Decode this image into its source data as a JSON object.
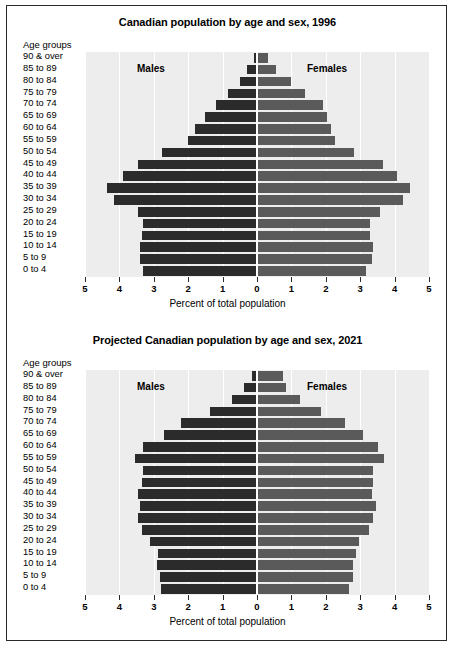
{
  "figure": {
    "axis_caption": "Percent of total population",
    "age_group_header": "Age groups",
    "males_label": "Males",
    "females_label": "Females",
    "male_color": "#2b2b2b",
    "female_color": "#5a5a5a",
    "plot_bg": "#ededed",
    "grid_color": "#ffffff",
    "tick_labels": [
      "5",
      "4",
      "3",
      "2",
      "1",
      "0",
      "1",
      "2",
      "3",
      "4",
      "5"
    ]
  },
  "chart_data": [
    {
      "type": "bar",
      "title": "Canadian population by age and sex, 1996",
      "orientation": "horizontal-pyramid",
      "xlabel": "Percent of total population",
      "ylabel": "Age groups",
      "xlim": [
        -5,
        5
      ],
      "xticks": [
        -5,
        -4,
        -3,
        -2,
        -1,
        0,
        1,
        2,
        3,
        4,
        5
      ],
      "xtick_labels": [
        "5",
        "4",
        "3",
        "2",
        "1",
        "0",
        "1",
        "2",
        "3",
        "4",
        "5"
      ],
      "grid": true,
      "legend": [
        "Males",
        "Females"
      ],
      "legend_position": "inside-top",
      "categories": [
        "90 & over",
        "85 to 89",
        "80 to 84",
        "75 to 79",
        "70 to 74",
        "65 to 69",
        "60 to 64",
        "55 to 59",
        "50 to 54",
        "45 to 49",
        "40 to 44",
        "35 to 39",
        "30 to 34",
        "25 to 29",
        "20 to 24",
        "15 to 19",
        "10 to 14",
        "5 to 9",
        "0 to 4"
      ],
      "series": [
        {
          "name": "Males",
          "values": [
            0.1,
            0.28,
            0.5,
            0.85,
            1.2,
            1.5,
            1.8,
            2.0,
            2.75,
            3.45,
            3.9,
            4.35,
            4.15,
            3.45,
            3.3,
            3.35,
            3.4,
            3.4,
            3.3
          ]
        },
        {
          "name": "Females",
          "values": [
            0.3,
            0.52,
            0.97,
            1.38,
            1.9,
            2.0,
            2.12,
            2.25,
            2.8,
            3.62,
            4.05,
            4.42,
            4.22,
            3.55,
            3.25,
            3.25,
            3.35,
            3.32,
            3.15
          ]
        }
      ]
    },
    {
      "type": "bar",
      "title": "Projected Canadian population by age and sex, 2021",
      "orientation": "horizontal-pyramid",
      "xlabel": "Percent of total population",
      "ylabel": "Age groups",
      "xlim": [
        -5,
        5
      ],
      "xticks": [
        -5,
        -4,
        -3,
        -2,
        -1,
        0,
        1,
        2,
        3,
        4,
        5
      ],
      "xtick_labels": [
        "5",
        "4",
        "3",
        "2",
        "1",
        "0",
        "1",
        "2",
        "3",
        "4",
        "5"
      ],
      "grid": true,
      "legend": [
        "Males",
        "Females"
      ],
      "legend_position": "inside-top",
      "categories": [
        "90 & over",
        "85 to 89",
        "80 to 84",
        "75 to 79",
        "70 to 74",
        "65 to 69",
        "60 to 64",
        "55 to 59",
        "50 to 54",
        "45 to 49",
        "40 to 44",
        "35 to 39",
        "30 to 34",
        "25 to 29",
        "20 to 24",
        "15 to 19",
        "10 to 14",
        "5 to 9",
        "0 to 4"
      ],
      "series": [
        {
          "name": "Males",
          "values": [
            0.15,
            0.38,
            0.72,
            1.38,
            2.2,
            2.7,
            3.3,
            3.55,
            3.3,
            3.35,
            3.45,
            3.4,
            3.45,
            3.35,
            3.12,
            2.88,
            2.92,
            2.82,
            2.78
          ]
        },
        {
          "name": "Females",
          "values": [
            0.72,
            0.82,
            1.22,
            1.82,
            2.52,
            3.05,
            3.5,
            3.65,
            3.35,
            3.35,
            3.32,
            3.42,
            3.35,
            3.22,
            2.95,
            2.85,
            2.75,
            2.75,
            2.65
          ]
        }
      ]
    }
  ]
}
